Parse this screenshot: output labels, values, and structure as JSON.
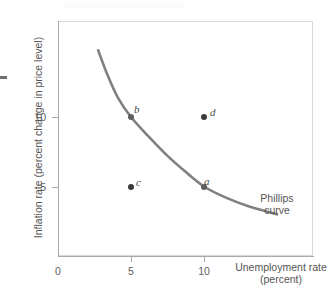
{
  "chart_data": {
    "type": "line",
    "title": "",
    "subtitle": "",
    "xlabel": "Unemployment rate",
    "xlabel_line2": "(percent)",
    "ylabel": "Inflation rate (percent change in price level)",
    "xlim": [
      0,
      17.5
    ],
    "ylim": [
      0,
      16.8
    ],
    "xticks": [
      0,
      5,
      10
    ],
    "xtick_labels": [
      "0",
      "5",
      "10"
    ],
    "yticks": [
      5,
      10
    ],
    "ytick_labels": [
      "5",
      "10"
    ],
    "grid": false,
    "legend_position": "none",
    "annotations": [
      {
        "name": "phillips-curve-label",
        "line1": "Phillips",
        "line2": "curve",
        "x": 15.0,
        "y": 4.2
      }
    ],
    "series": [
      {
        "name": "Phillips curve",
        "type": "line",
        "color": "#808080",
        "linewidth": 2.6,
        "points": [
          {
            "x": 2.75,
            "y": 14.8
          },
          {
            "x": 3.4,
            "y": 13.0
          },
          {
            "x": 4.1,
            "y": 11.4
          },
          {
            "x": 5.0,
            "y": 10.0
          },
          {
            "x": 6.2,
            "y": 8.6
          },
          {
            "x": 7.5,
            "y": 7.2
          },
          {
            "x": 8.8,
            "y": 6.0
          },
          {
            "x": 10.0,
            "y": 5.0
          },
          {
            "x": 11.5,
            "y": 4.2
          },
          {
            "x": 13.0,
            "y": 3.6
          },
          {
            "x": 15.0,
            "y": 3.0
          }
        ]
      },
      {
        "name": "labeled points",
        "type": "scatter",
        "color": "#3b3b3b",
        "points": [
          {
            "label": "a",
            "x": 10,
            "y": 5,
            "on_curve": true,
            "label_dx": 0,
            "label_dy": -11
          },
          {
            "label": "b",
            "x": 5,
            "y": 10,
            "on_curve": true,
            "label_dx": 3,
            "label_dy": -13
          },
          {
            "label": "c",
            "x": 5,
            "y": 5,
            "on_curve": false,
            "label_dx": 5,
            "label_dy": -10
          },
          {
            "label": "d",
            "x": 10,
            "y": 10,
            "on_curve": false,
            "label_dx": 6,
            "label_dy": -10
          }
        ]
      }
    ]
  },
  "axes": {
    "x_title_line1": "Unemployment rate",
    "x_title_line2": "(percent)",
    "y_title": "Inflation rate (percent change in price level)",
    "x_ticks": [
      {
        "value": "0"
      },
      {
        "value": "5"
      },
      {
        "value": "10"
      }
    ],
    "y_ticks": [
      {
        "value": "10"
      },
      {
        "value": "5"
      }
    ]
  },
  "labels": {
    "point_a": "a",
    "point_b": "b",
    "point_c": "c",
    "point_d": "d",
    "curve_line1": "Phillips",
    "curve_line2": "curve"
  },
  "colors": {
    "curve": "#808080",
    "point": "#3b3b3b",
    "axis": "#a9a9a9",
    "frame": "#d8d8d8",
    "text": "#555555",
    "background": "#ffffff"
  }
}
